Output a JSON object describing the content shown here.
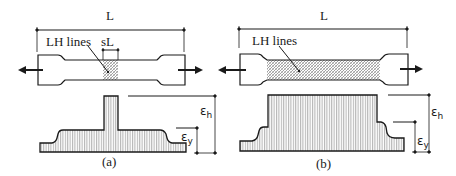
{
  "figure": {
    "panel_a": {
      "caption": "(a)",
      "length_label": "L",
      "hatch_label": "LH lines",
      "segment_label": "sL",
      "strain_high": {
        "symbol": "ε",
        "subscript": "h"
      },
      "strain_yield": {
        "symbol": "ε",
        "subscript": "y"
      }
    },
    "panel_b": {
      "caption": "(b)",
      "length_label": "L",
      "hatch_label": "LH lines",
      "strain_high": {
        "symbol": "ε",
        "subscript": "h"
      },
      "strain_yield": {
        "symbol": "ε",
        "subscript": "y"
      }
    },
    "colors": {
      "ink": "#1a1a1a",
      "hatch": "#8a8a8a",
      "background": "#ffffff"
    }
  }
}
